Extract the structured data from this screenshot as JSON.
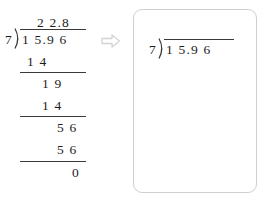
{
  "worked_example": {
    "divisor": "7",
    "dividend": "1 5.9 6",
    "quotient": "2 2.8",
    "steps": [
      {
        "label": "subtract-14",
        "value": "1 4"
      },
      {
        "label": "bring-down-19",
        "value": "1 9"
      },
      {
        "label": "subtract-14-second",
        "value": "1 4"
      },
      {
        "label": "bring-down-56",
        "value": "5 6"
      },
      {
        "label": "subtract-56",
        "value": "5 6"
      }
    ],
    "remainder": "0"
  },
  "arrow": {
    "icon": "right-arrow-outline-icon"
  },
  "practice_box": {
    "divisor": "7",
    "dividend": "1 5.9 6",
    "quotient": "",
    "border_color": "#cfcfcf"
  },
  "colors": {
    "ink": "#1c1c1c",
    "rule": "#3a3a3a",
    "box_border": "#cfcfcf",
    "arrow": "#d4d4d4",
    "background": "#ffffff"
  }
}
